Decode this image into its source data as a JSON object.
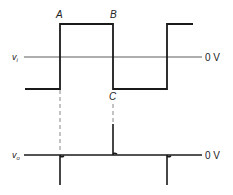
{
  "diagram": {
    "input": {
      "label": "v",
      "subscript": "i",
      "zero_label": "0 V",
      "points": {
        "A": "A",
        "B": "B",
        "C": "C"
      }
    },
    "output": {
      "label": "v",
      "subscript": "o",
      "zero_label": "0 V"
    },
    "colors": {
      "line": "#1a1a1a",
      "axis": "#333333",
      "dash": "#555555"
    }
  }
}
